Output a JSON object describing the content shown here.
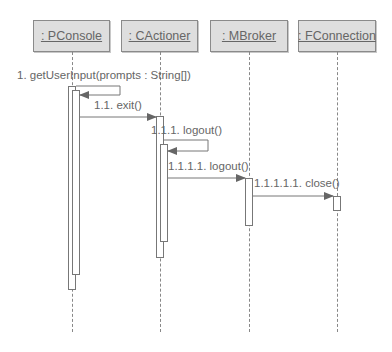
{
  "diagram": {
    "type": "sequence",
    "objects": [
      {
        "id": "pconsole",
        "label": ": PConsole"
      },
      {
        "id": "cactioner",
        "label": ": CActioner"
      },
      {
        "id": "mbroker",
        "label": ": MBroker"
      },
      {
        "id": "fconnection",
        "label": ": FConnection"
      }
    ],
    "messages": [
      {
        "label": "1. getUserInput(prompts : String[])",
        "from": "pconsole",
        "to": "pconsole"
      },
      {
        "label": "1.1. exit()",
        "from": "pconsole",
        "to": "cactioner"
      },
      {
        "label": "1.1.1. logout()",
        "from": "cactioner",
        "to": "cactioner"
      },
      {
        "label": "1.1.1.1. logout()",
        "from": "cactioner",
        "to": "mbroker"
      },
      {
        "label": "1.1.1.1.1. close()",
        "from": "mbroker",
        "to": "fconnection"
      }
    ],
    "colors": {
      "box_fill": "#dedede",
      "box_border": "#8a8a8a",
      "line": "#777777",
      "text": "#666666"
    }
  }
}
